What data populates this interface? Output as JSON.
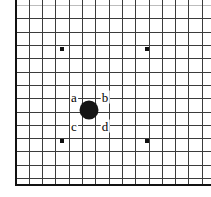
{
  "figure": {
    "kind": "go-board-diagram",
    "width": 211,
    "height": 197,
    "background_color": "#ffffff"
  },
  "board": {
    "line_color": "#3b3b3b",
    "faint_line_color": "#bdbdbd",
    "edge_color": "#111111",
    "grid_spacing": 13.3,
    "vertical_lines_x": [
      16,
      29.3,
      42.6,
      55.9,
      69.2,
      82.5,
      95.8,
      109.1,
      122.4,
      135.7,
      149,
      162.3,
      175.6,
      188.9,
      202.2
    ],
    "horizontal_lines_y": [
      5.6,
      18.9,
      32.2,
      45.5,
      58.8,
      72.1,
      85.4,
      98.7,
      112,
      125.3,
      138.6,
      151.9,
      165.2,
      178.5
    ],
    "left_edge_x": 16,
    "bottom_edge_y": 185
  },
  "star_points": [
    {
      "name": "star-top-left",
      "x": 62,
      "y": 49,
      "size": 4
    },
    {
      "name": "star-top-right",
      "x": 147,
      "y": 49,
      "size": 4
    },
    {
      "name": "star-bottom-left",
      "x": 62,
      "y": 141,
      "size": 4
    },
    {
      "name": "star-bottom-right",
      "x": 147,
      "y": 141,
      "size": 4
    }
  ],
  "stones": [
    {
      "name": "black-stone",
      "color": "#151515",
      "x": 89,
      "y": 110,
      "radius": 9.5
    }
  ],
  "labels": [
    {
      "id": "a",
      "text": "a",
      "x": 74,
      "y": 97
    },
    {
      "id": "b",
      "text": "b",
      "x": 105,
      "y": 97
    },
    {
      "id": "c",
      "text": "c",
      "x": 74,
      "y": 126
    },
    {
      "id": "d",
      "text": "d",
      "x": 105,
      "y": 126
    }
  ]
}
